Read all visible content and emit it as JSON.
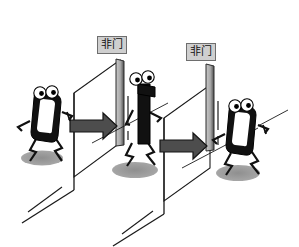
{
  "figure": {
    "background_color": "#ffffff"
  },
  "labels": [
    {
      "id": "not-gate-1",
      "text": "非门",
      "x": 97,
      "y": 36
    },
    {
      "id": "not-gate-2",
      "text": "非门",
      "x": 186,
      "y": 43
    }
  ],
  "characters": [
    {
      "id": "char-0-left",
      "digit": "0",
      "state": "input",
      "x": 48,
      "y": 120
    },
    {
      "id": "char-1-middle",
      "digit": "1",
      "state": "intermediate",
      "x": 145,
      "y": 110
    },
    {
      "id": "char-0-right",
      "digit": "0",
      "state": "output",
      "x": 243,
      "y": 132
    }
  ],
  "arrows": [
    {
      "id": "arrow-1",
      "direction": "right",
      "from": "char-0-left",
      "to": "not-gate-1"
    },
    {
      "id": "arrow-2",
      "direction": "right",
      "from": "char-1-middle",
      "to": "not-gate-2"
    }
  ],
  "gates": [
    {
      "id": "gate-panel-1",
      "label": "非门",
      "type": "NOT"
    },
    {
      "id": "gate-panel-2",
      "label": "非门",
      "type": "NOT"
    }
  ],
  "colors": {
    "ink": "#000000",
    "panel_light": "#b9b9b9",
    "panel_dark": "#5e5e5e",
    "shadow": "#9b9b9b",
    "label_fill": "#cfcfcf",
    "label_border": "#6e6e6e",
    "arrow_fill": "#4d4d4d",
    "background": "#ffffff"
  }
}
